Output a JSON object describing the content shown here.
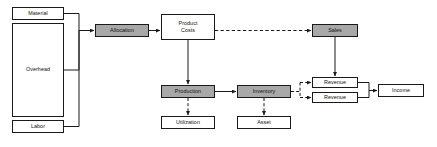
{
  "diagram": {
    "canvas": {
      "width": 437,
      "height": 147,
      "background": "#ffffff"
    },
    "style": {
      "filled_node_color": "#a8a8a8",
      "plain_node_color": "#ffffff",
      "border_color": "#1a1a1a",
      "edge_color": "#1a1a1a"
    },
    "nodes": [
      {
        "id": "material",
        "label": "Material",
        "x": 12,
        "y": 7,
        "w": 52,
        "h": 13,
        "fill": "plain"
      },
      {
        "id": "overhead",
        "label": "Overhead",
        "x": 12,
        "y": 23,
        "w": 52,
        "h": 94,
        "fill": "plain"
      },
      {
        "id": "labor",
        "label": "Labor",
        "x": 12,
        "y": 120,
        "w": 52,
        "h": 13,
        "fill": "plain"
      },
      {
        "id": "allocation",
        "label": "Allocation",
        "x": 95,
        "y": 24,
        "w": 54,
        "h": 13,
        "fill": "filled"
      },
      {
        "id": "product_costs",
        "label": "Product\nCosts",
        "x": 161,
        "y": 14,
        "w": 54,
        "h": 26,
        "fill": "plain"
      },
      {
        "id": "sales",
        "label": "Sales",
        "x": 312,
        "y": 24,
        "w": 46,
        "h": 13,
        "fill": "filled"
      },
      {
        "id": "production",
        "label": "Production",
        "x": 161,
        "y": 85,
        "w": 54,
        "h": 13,
        "fill": "filled"
      },
      {
        "id": "inventory",
        "label": "Inventory",
        "x": 237,
        "y": 85,
        "w": 54,
        "h": 13,
        "fill": "filled"
      },
      {
        "id": "revenue_top",
        "label": "Revenue",
        "x": 312,
        "y": 77,
        "w": 46,
        "h": 11,
        "fill": "plain"
      },
      {
        "id": "revenue_bot",
        "label": "Revenue",
        "x": 312,
        "y": 92,
        "w": 46,
        "h": 11,
        "fill": "plain"
      },
      {
        "id": "income",
        "label": "Income",
        "x": 378,
        "y": 84,
        "w": 46,
        "h": 13,
        "fill": "plain"
      },
      {
        "id": "utilization",
        "label": "Utilization",
        "x": 161,
        "y": 116,
        "w": 54,
        "h": 13,
        "fill": "plain"
      },
      {
        "id": "asset",
        "label": "Asset",
        "x": 237,
        "y": 116,
        "w": 54,
        "h": 13,
        "fill": "plain"
      }
    ],
    "edges": [
      {
        "id": "material-to-allocation",
        "from": "material",
        "to": "allocation",
        "style": "solid"
      },
      {
        "id": "overhead-to-allocation",
        "from": "overhead",
        "to": "allocation",
        "style": "solid"
      },
      {
        "id": "labor-to-allocation",
        "from": "labor",
        "to": "allocation",
        "style": "solid"
      },
      {
        "id": "allocation-to-product",
        "from": "allocation",
        "to": "product_costs",
        "style": "solid"
      },
      {
        "id": "product-to-sales",
        "from": "product_costs",
        "to": "sales",
        "style": "dashed"
      },
      {
        "id": "product-to-production",
        "from": "product_costs",
        "to": "production",
        "style": "solid"
      },
      {
        "id": "production-to-utilization",
        "from": "production",
        "to": "utilization",
        "style": "dashed"
      },
      {
        "id": "production-to-inventory",
        "from": "production",
        "to": "inventory",
        "style": "solid"
      },
      {
        "id": "inventory-to-asset",
        "from": "inventory",
        "to": "asset",
        "style": "dashed"
      },
      {
        "id": "inventory-to-revenue-top",
        "from": "inventory",
        "to": "revenue_top",
        "style": "dashed"
      },
      {
        "id": "inventory-to-revenue-bot",
        "from": "inventory",
        "to": "revenue_bot",
        "style": "dashed"
      },
      {
        "id": "sales-to-revenue-top",
        "from": "sales",
        "to": "revenue_top",
        "style": "solid"
      },
      {
        "id": "revenues-to-income",
        "from": "revenue_top",
        "to": "income",
        "style": "solid"
      }
    ]
  }
}
